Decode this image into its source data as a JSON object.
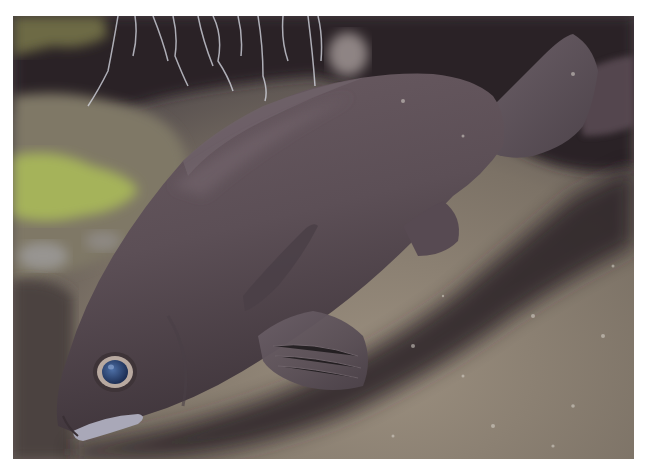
{
  "photo": {
    "subject": "dark grey-brown fish (grouper-like) resting near rocky seabed under a ledge",
    "frame": {
      "x": 13,
      "y": 16,
      "width": 621,
      "height": 443
    },
    "colors": {
      "page_background": "#ffffff",
      "fish_body": "#5e5158",
      "fish_shadow": "#3b3238",
      "fish_highlight": "#75676c",
      "eye_iris": "#2c4a7a",
      "eye_ring": "#b8a9a0",
      "seabed": "#8a7f70",
      "algae": "#a7b45a",
      "dark_cave": "#231f24",
      "lip": "#a9a8b8"
    }
  }
}
